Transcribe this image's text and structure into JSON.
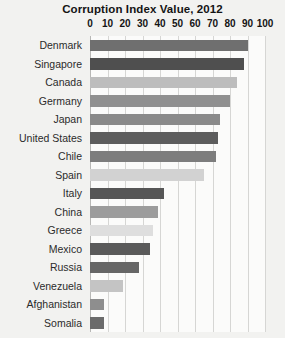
{
  "chart_data": {
    "type": "bar",
    "title": "Corruption Index Value, 2012",
    "xlabel": "",
    "ylabel": "",
    "orientation": "horizontal",
    "xlim": [
      0,
      100
    ],
    "xticks": [
      0,
      10,
      20,
      30,
      40,
      50,
      60,
      70,
      80,
      90,
      100
    ],
    "xtick_labels": [
      "0",
      "10",
      "20",
      "30",
      "40",
      "50",
      "60",
      "70",
      "80",
      "90",
      "100"
    ],
    "grid": true,
    "legend": "none",
    "categories": [
      "Denmark",
      "Singapore",
      "Canada",
      "Germany",
      "Japan",
      "United States",
      "Chile",
      "Spain",
      "Italy",
      "China",
      "Greece",
      "Mexico",
      "Russia",
      "Venezuela",
      "Afghanistan",
      "Somalia"
    ],
    "values": [
      90,
      88,
      84,
      80,
      74,
      73,
      72,
      65,
      42,
      39,
      36,
      34,
      28,
      19,
      8,
      8
    ],
    "bar_colors": [
      "#6f6f6f",
      "#4f4f4f",
      "#bdbdbd",
      "#909090",
      "#8a8a8a",
      "#5d5d5d",
      "#7d7d7d",
      "#d2d2d2",
      "#565656",
      "#9c9c9c",
      "#dedede",
      "#5a5a5a",
      "#666666",
      "#c4c4c4",
      "#8e8e8e",
      "#6b6b6b"
    ]
  }
}
